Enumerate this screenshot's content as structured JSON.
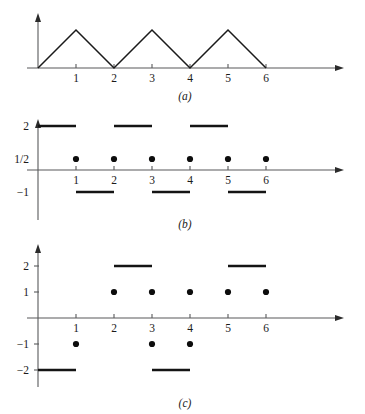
{
  "figure": {
    "panels": [
      {
        "id": "a",
        "caption": "(a)",
        "x_tick_labels": [
          "1",
          "2",
          "3",
          "4",
          "5",
          "6"
        ],
        "y_tick_labels": []
      },
      {
        "id": "b",
        "caption": "(b)",
        "x_tick_labels": [
          "1",
          "2",
          "3",
          "4",
          "5",
          "6"
        ],
        "y_tick_labels": [
          "2",
          "1/2",
          "−1"
        ]
      },
      {
        "id": "c",
        "caption": "(c)",
        "x_tick_labels": [
          "1",
          "2",
          "3",
          "4",
          "5",
          "6"
        ],
        "y_tick_labels": [
          "2",
          "1",
          "−1",
          "−2"
        ]
      }
    ]
  },
  "chart_data": [
    {
      "type": "line",
      "panel": "a",
      "title": "(a)",
      "xlabel": "",
      "ylabel": "",
      "xlim": [
        0,
        7.9
      ],
      "ylim": [
        0,
        1.25
      ],
      "grid": false,
      "legend": null,
      "description": "Triangular sawtooth wave of period 2, rising from 0 to peak 1 over each odd interval and falling back to 0.",
      "xticks": [
        1,
        2,
        3,
        4,
        5,
        6
      ],
      "xtick_labels": [
        "1",
        "2",
        "3",
        "4",
        "5",
        "6"
      ],
      "yticks": [],
      "ytick_labels": [],
      "series": [
        {
          "name": "triangle-wave",
          "x": [
            0,
            1,
            2,
            3,
            4,
            5,
            6
          ],
          "y": [
            0,
            1,
            0,
            1,
            0,
            1,
            0
          ]
        }
      ]
    },
    {
      "type": "bar",
      "panel": "b",
      "title": "(b)",
      "xlabel": "",
      "ylabel": "",
      "xlim": [
        0,
        7.9
      ],
      "ylim": [
        -1.6,
        2.6
      ],
      "grid": false,
      "legend": null,
      "description": "Square wave taking value 2 on intervals (0,1), (2,3), (4,5) and value -1 on intervals (1,2), (3,4), (5,6); dots mark the average value 1/2 at each integer jump point.",
      "xticks": [
        1,
        2,
        3,
        4,
        5,
        6
      ],
      "xtick_labels": [
        "1",
        "2",
        "3",
        "4",
        "5",
        "6"
      ],
      "yticks": [
        2,
        0.5,
        -1
      ],
      "ytick_labels": [
        "2",
        "1/2",
        "−1"
      ],
      "segments": [
        {
          "x_start": 0,
          "x_end": 1,
          "value": 2
        },
        {
          "x_start": 2,
          "x_end": 3,
          "value": 2
        },
        {
          "x_start": 4,
          "x_end": 5,
          "value": 2
        },
        {
          "x_start": 1,
          "x_end": 2,
          "value": -1
        },
        {
          "x_start": 3,
          "x_end": 4,
          "value": -1
        },
        {
          "x_start": 5,
          "x_end": 6,
          "value": -1
        }
      ],
      "points": [
        {
          "x": 1,
          "y": 0.5
        },
        {
          "x": 2,
          "y": 0.5
        },
        {
          "x": 3,
          "y": 0.5
        },
        {
          "x": 4,
          "y": 0.5
        },
        {
          "x": 5,
          "y": 0.5
        },
        {
          "x": 6,
          "y": 0.5
        }
      ]
    },
    {
      "type": "bar",
      "panel": "c",
      "title": "(c)",
      "xlabel": "",
      "ylabel": "",
      "xlim": [
        0,
        7.9
      ],
      "ylim": [
        -2.6,
        2.6
      ],
      "grid": false,
      "legend": null,
      "description": "Step function taking value -2 on (0,1), 2 on (2,3), -2 on (3,4) and 2 on (5,6); dots mark values 1 at x = 2,3,4,5,6 and -1 at x = 1,3,4.",
      "xticks": [
        1,
        2,
        3,
        4,
        5,
        6
      ],
      "xtick_labels": [
        "1",
        "2",
        "3",
        "4",
        "5",
        "6"
      ],
      "yticks": [
        2,
        1,
        -1,
        -2
      ],
      "ytick_labels": [
        "2",
        "1",
        "−1",
        "−2"
      ],
      "segments": [
        {
          "x_start": 2,
          "x_end": 3,
          "value": 2
        },
        {
          "x_start": 5,
          "x_end": 6,
          "value": 2
        },
        {
          "x_start": 0,
          "x_end": 1,
          "value": -2
        },
        {
          "x_start": 3,
          "x_end": 4,
          "value": -2
        }
      ],
      "points": [
        {
          "x": 2,
          "y": 1
        },
        {
          "x": 3,
          "y": 1
        },
        {
          "x": 4,
          "y": 1
        },
        {
          "x": 5,
          "y": 1
        },
        {
          "x": 6,
          "y": 1
        },
        {
          "x": 1,
          "y": -1
        },
        {
          "x": 3,
          "y": -1
        },
        {
          "x": 4,
          "y": -1
        }
      ]
    }
  ]
}
